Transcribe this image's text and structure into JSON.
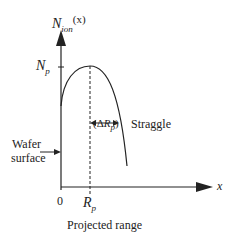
{
  "figure": {
    "y_axis_label": {
      "base": "N",
      "sub": "ion",
      "arg": "(x)"
    },
    "peak_label": {
      "base": "N",
      "sub": "p"
    },
    "x_axis_label": "x",
    "origin_label": "0",
    "rp_label": {
      "base": "R",
      "sub": "p"
    },
    "straggle_symbol": {
      "prefix": "(Δ",
      "base": "R",
      "sub": "p",
      "suffix": ")"
    },
    "straggle_label": "Straggle",
    "wafer_label_line1": "Wafer",
    "wafer_label_line2": "surface",
    "projected_range_label": "Projected range",
    "colors": {
      "line": "#222222",
      "background": "#ffffff"
    }
  }
}
